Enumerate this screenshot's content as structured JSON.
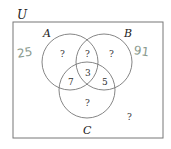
{
  "universe_label": "U",
  "sets": [
    {
      "label": "A"
    },
    {
      "label": "B"
    },
    {
      "label": "C"
    }
  ],
  "regions": {
    "a_only": "?",
    "a_and_b_only": "?",
    "b_only": "?",
    "a_b_c": "3",
    "a_and_c_only": "7",
    "b_and_c_only": "5",
    "c_only": "?",
    "outside": "?"
  },
  "annotations": {
    "handwritten_left": "25",
    "handwritten_right": "91"
  }
}
